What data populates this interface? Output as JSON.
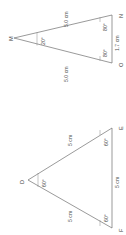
{
  "figure": {
    "background_color": "#ffffff",
    "stroke_color": "#6e6e6e",
    "text_color": "#4d4d4d",
    "text_orientation": "rotated-90-degrees"
  },
  "triangles": [
    {
      "id": "triangle-mno",
      "name": "Triangle MNO",
      "vertices": [
        {
          "label": "M",
          "x": 14,
          "y": 38
        },
        {
          "label": "N",
          "x": 112,
          "y": 15
        },
        {
          "label": "O",
          "x": 112,
          "y": 63
        }
      ],
      "sides": [
        {
          "label": "5.0 cm",
          "from": "M",
          "to": "N"
        },
        {
          "label": "5.0 cm",
          "from": "M",
          "to": "O"
        },
        {
          "label": "1.7 cm",
          "from": "N",
          "to": "O"
        }
      ],
      "angles": [
        {
          "label": "20°",
          "at": "M"
        },
        {
          "label": "80°",
          "at": "N"
        },
        {
          "label": "80°",
          "at": "O"
        }
      ]
    },
    {
      "id": "triangle-def",
      "name": "Triangle DEF",
      "vertices": [
        {
          "label": "D",
          "x": 28,
          "y": 180
        },
        {
          "label": "E",
          "x": 112,
          "y": 128
        },
        {
          "label": "F",
          "x": 112,
          "y": 228
        }
      ],
      "sides": [
        {
          "label": "5 cm",
          "from": "D",
          "to": "E"
        },
        {
          "label": "5 cm",
          "from": "D",
          "to": "F"
        },
        {
          "label": "5 cm",
          "from": "E",
          "to": "F"
        }
      ],
      "angles": [
        {
          "label": "60°",
          "at": "D"
        },
        {
          "label": "60°",
          "at": "E"
        },
        {
          "label": "60°",
          "at": "F"
        }
      ]
    }
  ]
}
